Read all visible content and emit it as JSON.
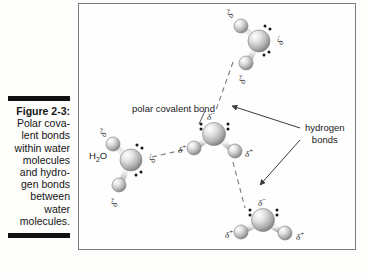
{
  "caption": {
    "figure_number": "Figure 2-3:",
    "lines": [
      "Polar cova-",
      "lent bonds",
      "within water",
      "molecules",
      "and hydro-",
      "gen bonds",
      "between",
      "water",
      "molecules."
    ]
  },
  "figure": {
    "labels": {
      "polar_covalent_bond": "polar covalent bond",
      "hydrogen_bonds_line1": "hydrogen",
      "hydrogen_bonds_line2": "bonds",
      "h2o": "H2O"
    },
    "molecules": [
      {
        "name": "top-water-molecule",
        "oxygen_charge": "δ−",
        "hydrogen_charges": [
          "δ+",
          "δ+"
        ]
      },
      {
        "name": "left-water-molecule",
        "oxygen_charge": "δ−",
        "hydrogen_charges": [
          "δ+",
          "δ+"
        ]
      },
      {
        "name": "center-water-molecule",
        "oxygen_charge": "δ−",
        "hydrogen_charges": [
          "δ+",
          "δ+"
        ]
      },
      {
        "name": "bottom-water-molecule",
        "oxygen_charge": "δ−",
        "hydrogen_charges": [
          "δ+",
          "δ+"
        ]
      }
    ],
    "charge_symbols": {
      "delta_negative": "δ",
      "delta_negative_sup": "−",
      "delta_positive": "δ",
      "delta_positive_sup": "+"
    }
  },
  "colors": {
    "frame_border": "#7c7c7c",
    "caption_rule": "#111111",
    "text": "#1a1a1a",
    "bond_line": "#8a8a8a",
    "dashed_bond": "#7a7a7a",
    "arrow": "#3a3a3a",
    "atom_dark": "#8e8e8e",
    "atom_light": "#f2f2f2"
  }
}
